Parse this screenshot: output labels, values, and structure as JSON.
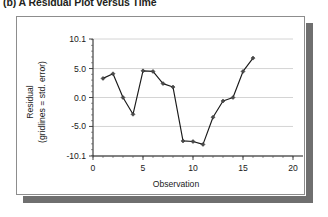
{
  "figure": {
    "caption": "(b) A Residual Plot versus Time"
  },
  "chart_data": {
    "type": "line",
    "title": "",
    "subtitle": "",
    "xlabel": "Observation",
    "ylabel": "Residual\n(gridlines = std. error)",
    "ylabel_line1": "Residual",
    "ylabel_line2": "(gridlines = std. error)",
    "x": [
      1,
      2,
      3,
      4,
      5,
      6,
      7,
      8,
      9,
      10,
      11,
      12,
      13,
      14,
      15,
      16
    ],
    "values": [
      3.3,
      4.1,
      0.0,
      -2.9,
      4.6,
      4.5,
      2.4,
      1.8,
      -7.5,
      -7.6,
      -8.1,
      -3.4,
      -0.6,
      0.0,
      4.5,
      6.8
    ],
    "series": [
      {
        "name": "Residual",
        "values": [
          3.3,
          4.1,
          0.0,
          -2.9,
          4.6,
          4.5,
          2.4,
          1.8,
          -7.5,
          -7.6,
          -8.1,
          -3.4,
          -0.6,
          0.0,
          4.5,
          6.8
        ]
      }
    ],
    "xlim": [
      0,
      20
    ],
    "ylim": [
      -10.1,
      10.1
    ],
    "xticks": [
      0,
      5,
      10,
      15,
      20
    ],
    "xtick_labels": [
      "0",
      "5",
      "10",
      "15",
      "20"
    ],
    "yticks": [
      -10.1,
      -5.0,
      0.0,
      5.0,
      10.1
    ],
    "ytick_labels": [
      "-10.1",
      "-5.0",
      "0.0",
      "5.0",
      "10.1"
    ],
    "grid": true,
    "grid_axis": "y",
    "legend": false,
    "legend_position": "none",
    "marker": "diamond",
    "line_color": "#1a1a1a",
    "grid_color": "#c9c9c9",
    "background": "#ffffff"
  }
}
